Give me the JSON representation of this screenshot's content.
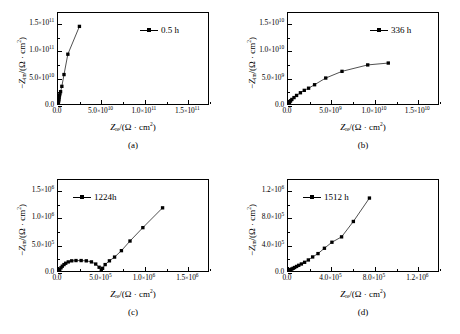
{
  "figure": {
    "panels": [
      {
        "caption": "(a)",
        "legend_label": "0.5 h",
        "xlabel_main": "Z",
        "xlabel_sub": "re",
        "xlabel_tail": "/(Ω · cm",
        "axis_unit_sup": "2",
        "ylabel_prefix": "−Z",
        "ylabel_sub": "im",
        "xticks": [
          "0.0",
          "5.0×10¹⁰",
          "1.0×10¹¹",
          "1.5×10¹¹"
        ],
        "yticks": [
          "0.0",
          "5.0×10¹⁰",
          "1.0×10¹¹",
          "1.5×10¹¹"
        ],
        "xtick_mant": [
          "0.0",
          "5.0",
          "1.0",
          "1.5"
        ],
        "xtick_exp": [
          "",
          "10",
          "11",
          "11"
        ],
        "ytick_mant": [
          "0.0",
          "5.0",
          "1.0",
          "1.5"
        ],
        "ytick_exp": [
          "",
          "10",
          "11",
          "11"
        ]
      },
      {
        "caption": "(b)",
        "legend_label": "336 h",
        "xtick_mant": [
          "0.0",
          "5.0",
          "1.0",
          "1.5"
        ],
        "xtick_exp": [
          "",
          "9",
          "10",
          "10"
        ],
        "ytick_mant": [
          "0.0",
          "5.0",
          "1.0",
          "1.5"
        ],
        "ytick_exp": [
          "",
          "9",
          "10",
          "10"
        ]
      },
      {
        "caption": "(c)",
        "legend_label": "1224h",
        "xtick_mant": [
          "0.0",
          "5.0",
          "1.0",
          "1.5"
        ],
        "xtick_exp": [
          "",
          "5",
          "6",
          "6"
        ],
        "ytick_mant": [
          "0.0",
          "5.0",
          "1.0",
          "1.5"
        ],
        "ytick_exp": [
          "",
          "5",
          "6",
          "6"
        ]
      },
      {
        "caption": "(d)",
        "legend_label": "1512 h",
        "xtick_mant": [
          "0.0",
          "4.0",
          "8.0",
          "1.2"
        ],
        "xtick_exp": [
          "",
          "5",
          "5",
          "6"
        ],
        "ytick_mant": [
          "0.0",
          "4.0",
          "8.0",
          "1.2"
        ],
        "ytick_exp": [
          "",
          "5",
          "5",
          "6"
        ]
      }
    ]
  },
  "chart_data": [
    {
      "type": "scatter",
      "panel": "(a)",
      "title": "",
      "series_name": "0.5 h",
      "xlabel": "Z_re/(Ω · cm²)",
      "ylabel": "−Z_im/(Ω · cm²)",
      "xlim": [
        0,
        175000000000.0
      ],
      "ylim": [
        0,
        170000000000.0
      ],
      "xticks": [
        0,
        50000000000.0,
        100000000000.0,
        150000000000.0
      ],
      "yticks": [
        0,
        50000000000.0,
        100000000000.0,
        150000000000.0
      ],
      "grid": false,
      "legend_position": "top-right",
      "marker": "filled-square",
      "line": "solid",
      "x": [
        300000000.0,
        400000000.0,
        500000000.0,
        600000000.0,
        800000000.0,
        1000000000.0,
        1300000000.0,
        1700000000.0,
        2200000000.0,
        3000000000.0,
        4500000000.0,
        7000000000.0,
        11500000000.0,
        25000000000.0
      ],
      "y": [
        1500000000.0,
        2500000000.0,
        4000000000.0,
        5500000000.0,
        7500000000.0,
        9500000000.0,
        12500000000.0,
        15500000000.0,
        19000000000.0,
        23000000000.0,
        33000000000.0,
        55000000000.0,
        93000000000.0,
        145000000000.0
      ]
    },
    {
      "type": "scatter",
      "panel": "(b)",
      "title": "",
      "series_name": "336 h",
      "xlabel": "Z_re/(Ω · cm²)",
      "ylabel": "−Z_im/(Ω · cm²)",
      "xlim": [
        0,
        17500000000.0
      ],
      "ylim": [
        0,
        17000000000.0
      ],
      "xticks": [
        0,
        5000000000.0,
        10000000000.0,
        15000000000.0
      ],
      "yticks": [
        0,
        5000000000.0,
        10000000000.0,
        15000000000.0
      ],
      "grid": false,
      "legend_position": "top-right",
      "marker": "filled-square",
      "line": "solid",
      "x": [
        30000000.0,
        60000000.0,
        100000000.0,
        150000000.0,
        220000000.0,
        300000000.0,
        450000000.0,
        700000000.0,
        1000000000.0,
        1450000000.0,
        1900000000.0,
        2400000000.0,
        3100000000.0,
        4400000000.0,
        6300000000.0,
        9300000000.0,
        11700000000.0
      ],
      "y": [
        50000000.0,
        120000000.0,
        200000000.0,
        320000000.0,
        450000000.0,
        600000000.0,
        850000000.0,
        1200000000.0,
        1600000000.0,
        2100000000.0,
        2550000000.0,
        2950000000.0,
        3600000000.0,
        4850000000.0,
        6100000000.0,
        7300000000.0,
        7650000000.0
      ]
    },
    {
      "type": "scatter",
      "panel": "(c)",
      "title": "",
      "series_name": "1224h",
      "xlabel": "Z_re/(Ω · cm²)",
      "ylabel": "−Z_im/(Ω · cm²)",
      "xlim": [
        0,
        1750000.0
      ],
      "ylim": [
        0,
        1700000.0
      ],
      "xticks": [
        0,
        500000.0,
        1000000.0,
        1500000.0
      ],
      "yticks": [
        0,
        500000.0,
        1000000.0,
        1500000.0
      ],
      "grid": false,
      "legend_position": "top-left",
      "marker": "filled-square",
      "line": "solid",
      "x": [
        10000.0,
        20000.0,
        35000.0,
        50000.0,
        70000.0,
        90000.0,
        120000.0,
        160000.0,
        210000.0,
        270000.0,
        330000.0,
        390000.0,
        440000.0,
        480000.0,
        505000.0,
        520000.0,
        550000.0,
        600000.0,
        660000.0,
        740000.0,
        840000.0,
        990000.0,
        1220000.0
      ],
      "y": [
        10000.0,
        30000.0,
        60000.0,
        90000.0,
        120000.0,
        145000.0,
        170000.0,
        190000.0,
        195000.0,
        195000.0,
        190000.0,
        170000.0,
        130000.0,
        70000.0,
        15000.0,
        50000.0,
        120000.0,
        190000.0,
        260000.0,
        380000.0,
        560000.0,
        810000.0,
        1180000.0
      ]
    },
    {
      "type": "scatter",
      "panel": "(d)",
      "title": "",
      "series_name": "1512 h",
      "xlabel": "Z_re/(Ω · cm²)",
      "ylabel": "−Z_im/(Ω · cm²)",
      "xlim": [
        0,
        1400000.0
      ],
      "ylim": [
        0,
        1360000.0
      ],
      "xticks": [
        0,
        400000.0,
        800000.0,
        1200000.0
      ],
      "yticks": [
        0,
        400000.0,
        800000.0,
        1200000.0
      ],
      "grid": false,
      "legend_position": "top-left",
      "marker": "filled-square",
      "line": "solid",
      "x": [
        5000.0,
        10000.0,
        18000.0,
        26000.0,
        36000.0,
        48000.0,
        62000.0,
        80000.0,
        100000.0,
        125000.0,
        155000.0,
        190000.0,
        230000.0,
        280000.0,
        340000.0,
        410000.0,
        500000.0,
        610000.0,
        760000.0
      ],
      "y": [
        4000.0,
        8000.0,
        15000.0,
        22000.0,
        30000.0,
        40000.0,
        52000.0,
        68000.0,
        85000.0,
        105000.0,
        130000.0,
        165000.0,
        210000.0,
        260000.0,
        340000.0,
        430000.0,
        510000.0,
        740000.0,
        1090000.0
      ]
    }
  ]
}
